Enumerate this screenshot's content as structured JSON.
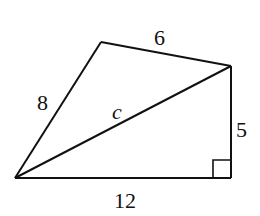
{
  "figure": {
    "type": "quadrilateral split by diagonal into two triangles",
    "vertices": {
      "A": {
        "x": 15,
        "y": 178
      },
      "B": {
        "x": 101,
        "y": 42
      },
      "C": {
        "x": 231,
        "y": 66
      },
      "D": {
        "x": 231,
        "y": 178
      }
    },
    "labels": {
      "side_AB": "8",
      "side_BC": "6",
      "side_CD": "5",
      "side_DA": "12",
      "diagonal_AC": "c"
    },
    "right_angle_at": "D",
    "line_color": "#111111"
  }
}
